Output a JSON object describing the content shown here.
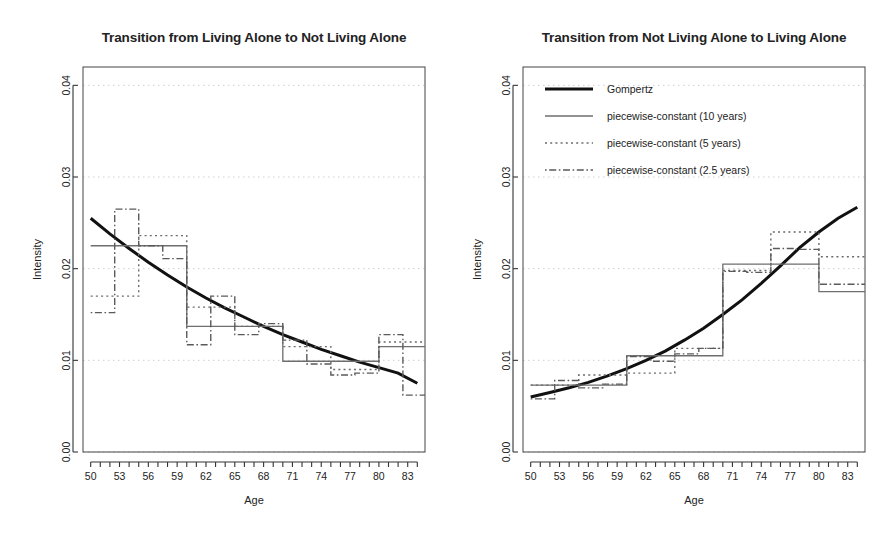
{
  "figure": {
    "background": "#ffffff",
    "panel_count": 2
  },
  "panels": [
    {
      "id": "left",
      "title": "Transition from Living Alone to Not Living Alone",
      "xlabel": "Age",
      "ylabel": "Intensity",
      "has_legend": false
    },
    {
      "id": "right",
      "title": "Transition from Not Living Alone to Living Alone",
      "xlabel": "Age",
      "ylabel": "Intensity",
      "has_legend": true
    }
  ],
  "legend": {
    "position": "top-left-inside",
    "entries": [
      {
        "label": "Gompertz",
        "style": "solid-thick",
        "color": "#000000"
      },
      {
        "label": "piecewise-constant (10 years)",
        "style": "solid-thin",
        "color": "#666666"
      },
      {
        "label": "piecewise-constant (5 years)",
        "style": "dotted",
        "color": "#666666"
      },
      {
        "label": "piecewise-constant (2.5 years)",
        "style": "dashdot",
        "color": "#555555"
      }
    ]
  },
  "axes": {
    "xlim": [
      49.2,
      84.8
    ],
    "ylim": [
      0.0,
      0.042
    ],
    "ytick_values": [
      0.0,
      0.01,
      0.02,
      0.03,
      0.04
    ],
    "ytick_labels": [
      "0.00",
      "0.01",
      "0.02",
      "0.03",
      "0.04"
    ],
    "xtick_values": [
      50,
      51,
      52,
      53,
      54,
      55,
      56,
      57,
      58,
      59,
      60,
      61,
      62,
      63,
      64,
      65,
      66,
      67,
      68,
      69,
      70,
      71,
      72,
      73,
      74,
      75,
      76,
      77,
      78,
      79,
      80,
      81,
      82,
      83,
      84
    ],
    "xtick_labeled": [
      50,
      53,
      56,
      59,
      62,
      65,
      68,
      71,
      74,
      77,
      80,
      83
    ],
    "xtick_labels": [
      "50",
      "53",
      "56",
      "59",
      "62",
      "65",
      "68",
      "71",
      "74",
      "77",
      "80",
      "83"
    ],
    "grid": "dotted-light-horizontal"
  },
  "chart_data": [
    {
      "type": "line",
      "panel": "left",
      "title": "Transition from Living Alone to Not Living Alone",
      "xlabel": "Age",
      "ylabel": "Intensity",
      "xlim": [
        49.2,
        84.8
      ],
      "ylim": [
        0.0,
        0.042
      ],
      "grid": true,
      "legend_position": "none",
      "series": [
        {
          "name": "Gompertz",
          "kind": "smooth-curve",
          "style": "solid-thick",
          "x": [
            50,
            52,
            54,
            56,
            58,
            60,
            62,
            64,
            66,
            68,
            70,
            72,
            74,
            76,
            78,
            80,
            82,
            84
          ],
          "y": [
            0.0255,
            0.0238,
            0.0222,
            0.0207,
            0.0193,
            0.018,
            0.0168,
            0.0157,
            0.0147,
            0.0137,
            0.0128,
            0.012,
            0.0112,
            0.0105,
            0.0098,
            0.0092,
            0.0086,
            0.0075
          ]
        },
        {
          "name": "piecewise-constant (10 years)",
          "kind": "step",
          "style": "solid-thin",
          "breaks": [
            50,
            60,
            70,
            80,
            85
          ],
          "values": [
            0.0225,
            0.0137,
            0.0099,
            0.0115
          ]
        },
        {
          "name": "piecewise-constant (5 years)",
          "kind": "step",
          "style": "dotted",
          "breaks": [
            50,
            55,
            60,
            65,
            70,
            75,
            80,
            85
          ],
          "values": [
            0.017,
            0.0236,
            0.0158,
            0.0137,
            0.0115,
            0.009,
            0.012
          ]
        },
        {
          "name": "piecewise-constant (2.5 years)",
          "kind": "step",
          "style": "dashdot",
          "breaks": [
            50,
            52.5,
            55,
            57.5,
            60,
            62.5,
            65,
            67.5,
            70,
            72.5,
            75,
            77.5,
            80,
            82.5,
            85
          ],
          "values": [
            0.0152,
            0.0265,
            0.0225,
            0.0211,
            0.0117,
            0.017,
            0.0128,
            0.014,
            0.0122,
            0.0096,
            0.0084,
            0.0086,
            0.0128,
            0.0062
          ]
        }
      ]
    },
    {
      "type": "line",
      "panel": "right",
      "title": "Transition from Not Living Alone to Living Alone",
      "xlabel": "Age",
      "ylabel": "Intensity",
      "xlim": [
        49.2,
        84.8
      ],
      "ylim": [
        0.0,
        0.042
      ],
      "grid": true,
      "legend_position": "upper-left",
      "series": [
        {
          "name": "Gompertz",
          "kind": "smooth-curve",
          "style": "solid-thick",
          "x": [
            50,
            52,
            54,
            56,
            58,
            60,
            62,
            64,
            66,
            68,
            70,
            72,
            74,
            76,
            78,
            80,
            82,
            84
          ],
          "y": [
            0.006,
            0.0065,
            0.007,
            0.0076,
            0.0083,
            0.0091,
            0.01,
            0.011,
            0.0122,
            0.0135,
            0.015,
            0.0166,
            0.0184,
            0.0203,
            0.0223,
            0.024,
            0.0255,
            0.0267
          ]
        },
        {
          "name": "piecewise-constant (10 years)",
          "kind": "step",
          "style": "solid-thin",
          "breaks": [
            50,
            60,
            70,
            80,
            85
          ],
          "values": [
            0.0073,
            0.0105,
            0.0205,
            0.0175
          ]
        },
        {
          "name": "piecewise-constant (5 years)",
          "kind": "step",
          "style": "dotted",
          "breaks": [
            50,
            55,
            60,
            65,
            70,
            75,
            80,
            85
          ],
          "values": [
            0.0073,
            0.0084,
            0.0086,
            0.0113,
            0.0198,
            0.024,
            0.0213
          ]
        },
        {
          "name": "piecewise-constant (2.5 years)",
          "kind": "step",
          "style": "dashdot",
          "breaks": [
            50,
            52.5,
            55,
            57.5,
            60,
            62.5,
            65,
            67.5,
            70,
            72.5,
            75,
            77.5,
            80,
            82.5,
            85
          ],
          "values": [
            0.0058,
            0.0078,
            0.007,
            0.0074,
            0.0104,
            0.0099,
            0.0107,
            0.0113,
            0.0197,
            0.0196,
            0.0222,
            0.0221,
            0.0183,
            0.0183
          ]
        }
      ]
    }
  ]
}
